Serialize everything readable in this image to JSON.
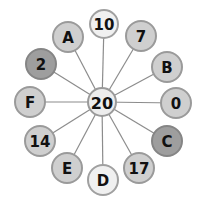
{
  "diagram": {
    "type": "wheel",
    "center": {
      "label": "20",
      "x": 102,
      "y": 102,
      "r": 14,
      "fill": "#ededed",
      "stroke": "#9a9a9a"
    },
    "edge_color": "#8c8c8c",
    "nodes": [
      {
        "label": "10",
        "x": 104,
        "y": 24,
        "r": 14,
        "fill": "#f0f0f0",
        "stroke": "#a0a0a0"
      },
      {
        "label": "7",
        "x": 141,
        "y": 36,
        "r": 15,
        "fill": "#cfcfcf",
        "stroke": "#9a9a9a"
      },
      {
        "label": "B",
        "x": 167,
        "y": 67,
        "r": 15,
        "fill": "#cfcfcf",
        "stroke": "#9a9a9a"
      },
      {
        "label": "0",
        "x": 176,
        "y": 103,
        "r": 15,
        "fill": "#cfcfcf",
        "stroke": "#9a9a9a"
      },
      {
        "label": "C",
        "x": 167,
        "y": 141,
        "r": 15,
        "fill": "#9e9e9e",
        "stroke": "#858585"
      },
      {
        "label": "17",
        "x": 139,
        "y": 168,
        "r": 15,
        "fill": "#cfcfcf",
        "stroke": "#9a9a9a"
      },
      {
        "label": "D",
        "x": 103,
        "y": 180,
        "r": 15,
        "fill": "#f0f0f0",
        "stroke": "#a0a0a0"
      },
      {
        "label": "E",
        "x": 67,
        "y": 168,
        "r": 15,
        "fill": "#cfcfcf",
        "stroke": "#9a9a9a"
      },
      {
        "label": "14",
        "x": 40,
        "y": 141,
        "r": 15,
        "fill": "#cfcfcf",
        "stroke": "#9a9a9a"
      },
      {
        "label": "F",
        "x": 30,
        "y": 102,
        "r": 15,
        "fill": "#cfcfcf",
        "stroke": "#9a9a9a"
      },
      {
        "label": "2",
        "x": 41,
        "y": 64,
        "r": 15,
        "fill": "#9e9e9e",
        "stroke": "#858585"
      },
      {
        "label": "A",
        "x": 68,
        "y": 37,
        "r": 15,
        "fill": "#cfcfcf",
        "stroke": "#9a9a9a"
      }
    ]
  }
}
